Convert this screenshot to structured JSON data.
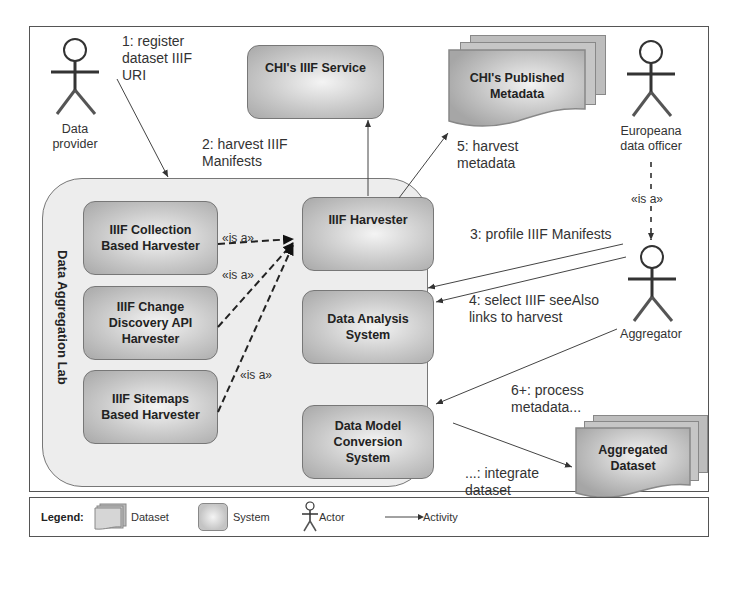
{
  "diagram": {
    "lab_title": "Data Aggregation Lab",
    "systems": {
      "chi_iiif_service": "CHI's IIIF Service",
      "iiif_harvester": "IIIF Harvester",
      "data_analysis": "Data Analysis\nSystem",
      "data_model_conversion": "Data Model\nConversion\nSystem",
      "collection_harvester": "IIIF Collection\nBased Harvester",
      "change_discovery_harvester": "IIIF Change\nDiscovery API\nHarvester",
      "sitemaps_harvester": "IIIF Sitemaps\nBased Harvester"
    },
    "datasets": {
      "chi_published_metadata": "CHI's Published\nMetadata",
      "aggregated_dataset": "Aggregated\nDataset"
    },
    "actors": {
      "data_provider": "Data\nprovider",
      "europeana_officer": "Europeana\ndata officer",
      "aggregator": "Aggregator"
    },
    "activities": {
      "step1": "1: register\ndataset IIIF\nURI",
      "step2": "2: harvest IIIF\nManifests",
      "step3": "3: profile IIIF Manifests",
      "step4": "4: select IIIF seeAlso\nlinks to harvest",
      "step5": "5: harvest\nmetadata",
      "step6": "6+: process\nmetadata...",
      "step_final": "...: integrate\ndataset"
    },
    "isa_label": "«is a»"
  },
  "legend": {
    "title": "Legend:",
    "dataset": "Dataset",
    "system": "System",
    "actor": "Actor",
    "activity": "Activity"
  }
}
